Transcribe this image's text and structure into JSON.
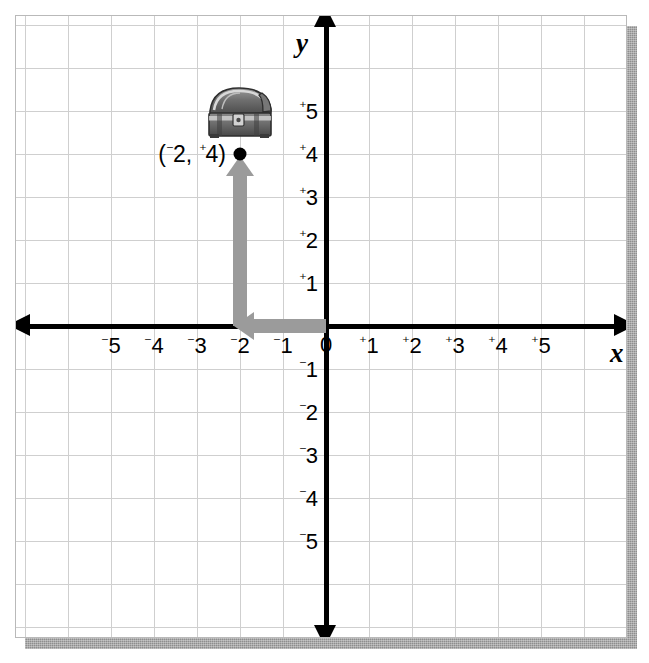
{
  "worksheet": {
    "background_color": "#ffffff",
    "border_color": "#b9b9b9",
    "shadow_color": "#8e8e8e",
    "grid_color": "#cfcfcf"
  },
  "chart_data": {
    "type": "scatter",
    "title": "",
    "xlabel": "x",
    "ylabel": "y",
    "xlim": [
      -6,
      6
    ],
    "ylim": [
      -6,
      6
    ],
    "grid": true,
    "legend": null,
    "axis_color": "#000000",
    "x_ticks": [
      {
        "value": -5,
        "label": "5",
        "sign": "⁻"
      },
      {
        "value": -4,
        "label": "4",
        "sign": "⁻"
      },
      {
        "value": -3,
        "label": "3",
        "sign": "⁻"
      },
      {
        "value": -2,
        "label": "2",
        "sign": "⁻"
      },
      {
        "value": -1,
        "label": "1",
        "sign": "⁻"
      },
      {
        "value": 0,
        "label": "0",
        "sign": ""
      },
      {
        "value": 1,
        "label": "1",
        "sign": "⁺"
      },
      {
        "value": 2,
        "label": "2",
        "sign": "⁺"
      },
      {
        "value": 3,
        "label": "3",
        "sign": "⁺"
      },
      {
        "value": 4,
        "label": "4",
        "sign": "⁺"
      },
      {
        "value": 5,
        "label": "5",
        "sign": "⁺"
      }
    ],
    "y_ticks": [
      {
        "value": 5,
        "label": "5",
        "sign": "⁺"
      },
      {
        "value": 4,
        "label": "4",
        "sign": "⁺"
      },
      {
        "value": 3,
        "label": "3",
        "sign": "⁺"
      },
      {
        "value": 2,
        "label": "2",
        "sign": "⁺"
      },
      {
        "value": 1,
        "label": "1",
        "sign": "⁺"
      },
      {
        "value": -1,
        "label": "1",
        "sign": "⁻"
      },
      {
        "value": -2,
        "label": "2",
        "sign": "⁻"
      },
      {
        "value": -3,
        "label": "3",
        "sign": "⁻"
      },
      {
        "value": -4,
        "label": "4",
        "sign": "⁻"
      },
      {
        "value": -5,
        "label": "5",
        "sign": "⁻"
      }
    ],
    "points": [
      {
        "name": "treasure-location",
        "x": -2,
        "y": 4,
        "label_x": "2",
        "label_x_sign": "⁻",
        "label_y": "4",
        "label_y_sign": "⁺",
        "marker": "filled-circle",
        "marker_color": "#000000"
      }
    ],
    "annotations": [
      {
        "name": "horizontal-move-arrow",
        "type": "arrow",
        "from": [
          0,
          0
        ],
        "to": [
          -2,
          0
        ],
        "direction": "left",
        "color": "#9b9b9b"
      },
      {
        "name": "vertical-move-arrow",
        "type": "arrow",
        "from": [
          -2,
          0
        ],
        "to": [
          -2,
          4
        ],
        "direction": "up",
        "color": "#9b9b9b"
      },
      {
        "name": "treasure-chest-image",
        "type": "image",
        "at": [
          -2,
          5
        ],
        "description": "treasure-chest"
      }
    ]
  },
  "labels": {
    "x_axis_name": "x",
    "y_axis_name": "y",
    "point_label_open": "(",
    "point_label_comma": ", ",
    "point_label_close": ")"
  }
}
